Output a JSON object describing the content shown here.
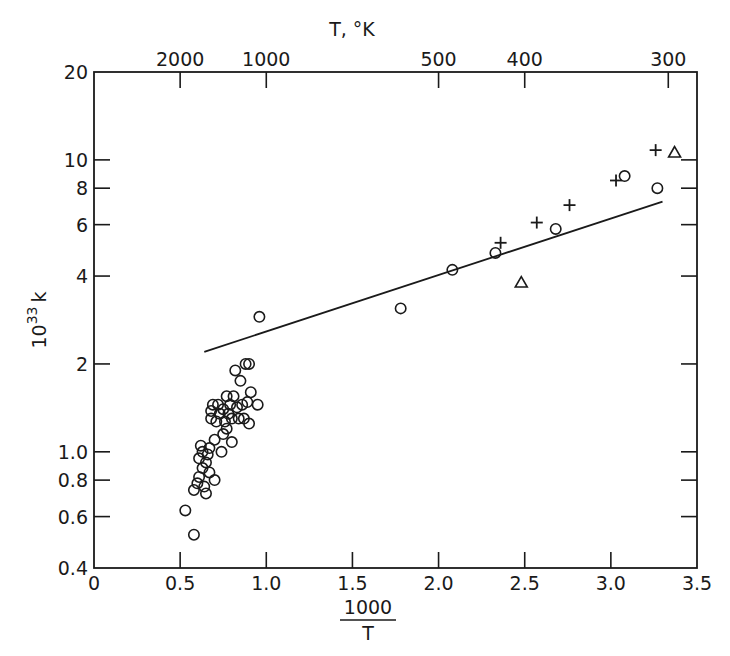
{
  "chart_data": {
    "type": "scatter",
    "title": "",
    "xlabel": "1000/T",
    "xlabel_numerator": "1000",
    "xlabel_denominator": "T",
    "ylabel": "10^33 k",
    "ylabel_base": "10",
    "ylabel_exp": "33",
    "ylabel_var": "k",
    "top_axis_label": "T, °K",
    "xlim": [
      0,
      3.5
    ],
    "ylim": [
      0.4,
      20
    ],
    "yscale": "log",
    "grid": false,
    "legend": null,
    "x_ticks": [
      {
        "value": 0,
        "label": "0"
      },
      {
        "value": 0.5,
        "label": "0.5"
      },
      {
        "value": 1.0,
        "label": "1.0"
      },
      {
        "value": 1.5,
        "label": "1.5"
      },
      {
        "value": 2.0,
        "label": "2.0"
      },
      {
        "value": 2.5,
        "label": "2.5"
      },
      {
        "value": 3.0,
        "label": "3.0"
      },
      {
        "value": 3.5,
        "label": "3.5"
      }
    ],
    "y_ticks": [
      {
        "value": 0.4,
        "label": "0.4"
      },
      {
        "value": 0.6,
        "label": "0.6"
      },
      {
        "value": 0.8,
        "label": "0.8"
      },
      {
        "value": 1.0,
        "label": "1.0"
      },
      {
        "value": 2,
        "label": "2"
      },
      {
        "value": 4,
        "label": "4"
      },
      {
        "value": 6,
        "label": "6"
      },
      {
        "value": 8,
        "label": "8"
      },
      {
        "value": 10,
        "label": "10"
      },
      {
        "value": 20,
        "label": "20"
      }
    ],
    "top_ticks": [
      {
        "T": 2000,
        "label": "2000"
      },
      {
        "T": 1000,
        "label": "1000"
      },
      {
        "T": 500,
        "label": "500"
      },
      {
        "T": 400,
        "label": "400"
      },
      {
        "T": 300,
        "label": "300"
      }
    ],
    "fit_line": {
      "x": [
        0.64,
        3.3
      ],
      "y": [
        2.2,
        7.2
      ]
    },
    "series": [
      {
        "name": "circles",
        "marker": "circle",
        "points": [
          [
            0.53,
            0.63
          ],
          [
            0.58,
            0.52
          ],
          [
            0.58,
            0.74
          ],
          [
            0.6,
            0.78
          ],
          [
            0.61,
            0.82
          ],
          [
            0.61,
            0.95
          ],
          [
            0.62,
            1.05
          ],
          [
            0.63,
            1.0
          ],
          [
            0.63,
            0.88
          ],
          [
            0.64,
            0.76
          ],
          [
            0.65,
            0.72
          ],
          [
            0.65,
            0.92
          ],
          [
            0.66,
            0.98
          ],
          [
            0.67,
            0.85
          ],
          [
            0.67,
            1.03
          ],
          [
            0.68,
            1.3
          ],
          [
            0.68,
            1.38
          ],
          [
            0.69,
            1.45
          ],
          [
            0.7,
            0.8
          ],
          [
            0.7,
            1.1
          ],
          [
            0.71,
            1.27
          ],
          [
            0.72,
            1.45
          ],
          [
            0.73,
            1.35
          ],
          [
            0.74,
            1.0
          ],
          [
            0.75,
            1.15
          ],
          [
            0.75,
            1.4
          ],
          [
            0.76,
            1.27
          ],
          [
            0.77,
            1.55
          ],
          [
            0.77,
            1.2
          ],
          [
            0.78,
            1.35
          ],
          [
            0.79,
            1.45
          ],
          [
            0.8,
            1.08
          ],
          [
            0.8,
            1.3
          ],
          [
            0.81,
            1.55
          ],
          [
            0.82,
            1.9
          ],
          [
            0.83,
            1.42
          ],
          [
            0.84,
            1.3
          ],
          [
            0.85,
            1.75
          ],
          [
            0.86,
            1.45
          ],
          [
            0.87,
            1.3
          ],
          [
            0.88,
            2.0
          ],
          [
            0.89,
            1.48
          ],
          [
            0.9,
            2.0
          ],
          [
            0.9,
            1.25
          ],
          [
            0.91,
            1.6
          ],
          [
            0.95,
            1.45
          ],
          [
            0.96,
            2.9
          ],
          [
            1.78,
            3.1
          ],
          [
            2.08,
            4.2
          ],
          [
            2.33,
            4.8
          ],
          [
            2.68,
            5.8
          ],
          [
            3.08,
            8.8
          ],
          [
            3.27,
            8.0
          ]
        ]
      },
      {
        "name": "plus",
        "marker": "plus",
        "points": [
          [
            2.36,
            5.2
          ],
          [
            2.57,
            6.1
          ],
          [
            2.76,
            7.0
          ],
          [
            3.03,
            8.5
          ],
          [
            3.26,
            10.8
          ]
        ]
      },
      {
        "name": "triangles",
        "marker": "triangle",
        "points": [
          [
            2.48,
            3.8
          ],
          [
            3.37,
            10.6
          ]
        ]
      }
    ]
  }
}
